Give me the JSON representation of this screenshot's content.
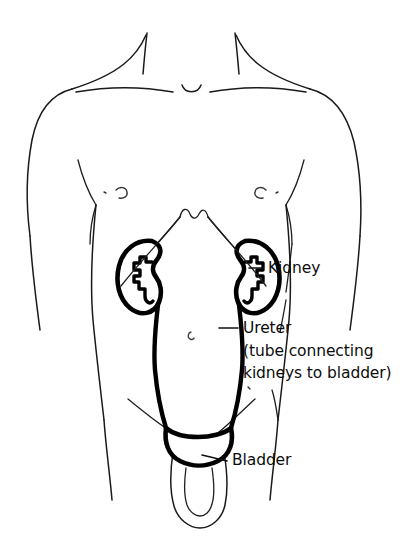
{
  "diagram": {
    "background_color": "#ffffff",
    "line_color": "#1a1a1a",
    "organ_color": "#000000",
    "labels": [
      {
        "id": "kidney",
        "text": "Kidney",
        "x": 268,
        "y": 273,
        "leader": "M 248 268 L 262 268"
      },
      {
        "id": "ureter",
        "text": "Ureter",
        "x": 243,
        "y": 333,
        "leader": "M 218 328 L 237 328"
      },
      {
        "id": "ureter_note_line1",
        "text": "(tube connecting",
        "x": 243,
        "y": 356
      },
      {
        "id": "ureter_note_line2",
        "text": "kidneys to bladder)",
        "x": 243,
        "y": 378
      },
      {
        "id": "bladder",
        "text": "Bladder",
        "x": 232,
        "y": 465,
        "leader": "M 203 455 L 226 460"
      }
    ],
    "organs": [
      {
        "id": "left-kidney",
        "name": "Kidney (left)"
      },
      {
        "id": "right-kidney",
        "name": "Kidney (right)"
      },
      {
        "id": "left-ureter",
        "name": "Ureter (left)"
      },
      {
        "id": "right-ureter",
        "name": "Ureter (right)"
      },
      {
        "id": "bladder",
        "name": "Bladder"
      }
    ],
    "body_parts": [
      {
        "id": "neck",
        "name": "Neck"
      },
      {
        "id": "clavicle",
        "name": "Clavicle"
      },
      {
        "id": "shoulder",
        "name": "Shoulder"
      },
      {
        "id": "left-arm",
        "name": "Left arm"
      },
      {
        "id": "right-arm",
        "name": "Right arm"
      },
      {
        "id": "torso",
        "name": "Torso"
      },
      {
        "id": "ribcage",
        "name": "Costal margin"
      },
      {
        "id": "nipples",
        "name": "Nipples"
      },
      {
        "id": "navel",
        "name": "Navel"
      },
      {
        "id": "groin",
        "name": "Groin crease"
      },
      {
        "id": "genitalia",
        "name": "Genitalia"
      }
    ]
  }
}
